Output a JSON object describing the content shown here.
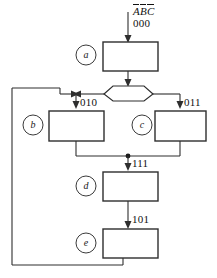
{
  "diagram": {
    "type": "asm-state-flow-chart",
    "canvas": {
      "width": 217,
      "height": 278,
      "background": "#ffffff"
    },
    "colors": {
      "stroke": "#2e2e2e",
      "line": "#2e2e2e",
      "text": "#111111",
      "fill": "#ffffff",
      "junction": "#1a1a1a"
    },
    "input_label": {
      "variables": [
        "A",
        "B",
        "C"
      ],
      "text": "ABC",
      "overbar": true
    },
    "states": [
      {
        "id": "a",
        "label": "a",
        "code": "000",
        "circle": {
          "cx": 86,
          "cy": 55,
          "r": 10
        },
        "box": {
          "x": 103,
          "y": 42,
          "w": 55,
          "h": 29
        }
      },
      {
        "id": "b",
        "label": "b",
        "code": "010",
        "circle": {
          "cx": 33,
          "cy": 125,
          "r": 10
        },
        "box": {
          "x": 49,
          "y": 111,
          "w": 55,
          "h": 30
        }
      },
      {
        "id": "c",
        "label": "c",
        "code": "011",
        "circle": {
          "cx": 142,
          "cy": 125,
          "r": 10
        },
        "box": {
          "x": 155,
          "y": 111,
          "w": 51,
          "h": 30
        }
      },
      {
        "id": "d",
        "label": "d",
        "code": "111",
        "circle": {
          "cx": 86,
          "cy": 186,
          "r": 10
        },
        "box": {
          "x": 103,
          "y": 172,
          "w": 55,
          "h": 29
        }
      },
      {
        "id": "e",
        "label": "e",
        "code": "101",
        "circle": {
          "cx": 86,
          "cy": 243,
          "r": 10
        },
        "box": {
          "x": 103,
          "y": 229,
          "w": 55,
          "h": 29
        }
      }
    ],
    "decision": {
      "name": "branch-hexagon",
      "points": "104,94 113,86 144,86 153,94 144,101 113,101 104,94",
      "center_x": 128,
      "center_y": 94
    },
    "codes": {
      "start": "000",
      "left_branch": "010",
      "right_branch": "011",
      "merge": "111",
      "last": "101"
    },
    "junctions": [
      {
        "name": "merge-dot",
        "x": 128,
        "y": 156
      }
    ],
    "edges": [
      {
        "name": "input-to-state-a",
        "from": "input",
        "to": "a"
      },
      {
        "name": "state-a-to-decision",
        "from": "a",
        "to": "decision"
      },
      {
        "name": "decision-to-state-b",
        "from": "decision",
        "to": "b",
        "code": "010"
      },
      {
        "name": "decision-to-state-c",
        "from": "decision",
        "to": "c",
        "code": "011"
      },
      {
        "name": "state-b-to-merge",
        "from": "b",
        "to": "merge"
      },
      {
        "name": "state-c-to-merge",
        "from": "c",
        "to": "merge"
      },
      {
        "name": "merge-to-state-d",
        "from": "merge",
        "to": "d",
        "code": "111"
      },
      {
        "name": "state-d-to-state-e",
        "from": "d",
        "to": "e",
        "code": "101"
      },
      {
        "name": "state-e-feedback-to-b",
        "from": "e",
        "to": "b-entry",
        "code": ""
      }
    ]
  }
}
